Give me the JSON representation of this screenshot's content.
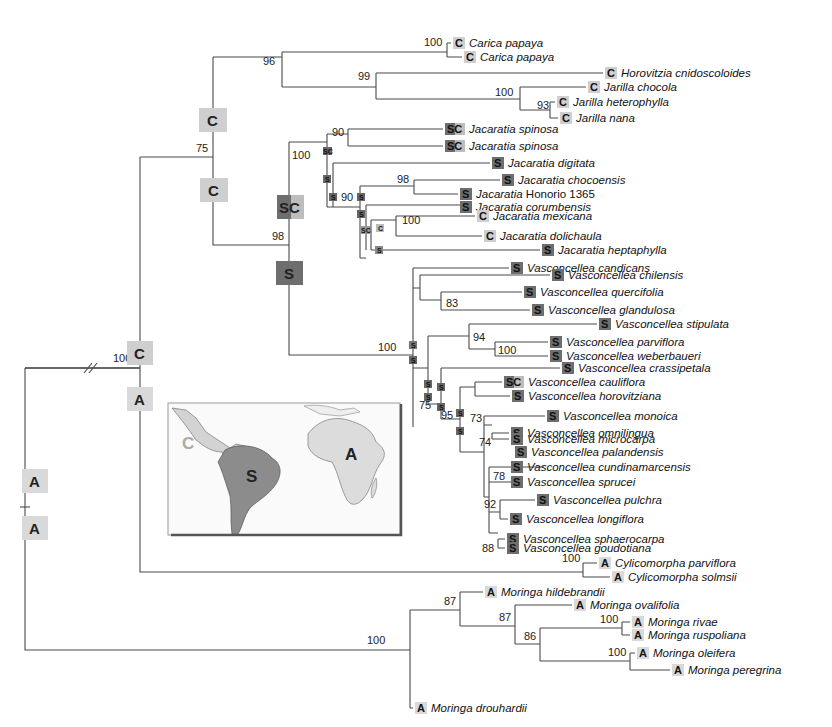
{
  "figure": {
    "type": "phylogenetic-tree",
    "legend_states": {
      "C": "Central America (light grey)",
      "S": "South America (dark grey)",
      "A": "Africa (light grey)",
      "SC": "South + Central America"
    },
    "colors": {
      "C": "#cfcfcf",
      "S": "#6e6e6e",
      "A": "#d9d9d9",
      "line": "#4a4a4a"
    },
    "map_inset": {
      "labels": {
        "C": "C",
        "S": "S",
        "A": "A"
      }
    },
    "root_support": "100",
    "ancestral_states": {
      "root_upper": "A",
      "root_lower": "A",
      "crown_above": "C",
      "crown_below": "A",
      "caricaceae_upper": "C",
      "node75_lower": "C",
      "jacaratia_stem": "SC",
      "vasconcellea_stem": "S"
    },
    "supports": {
      "n96": "96",
      "n75": "75",
      "n100_carica": "100",
      "n99": "99",
      "n100_jarilla": "100",
      "n93": "93",
      "n98": "98",
      "n100_jac": "100",
      "n90_spinosa": "90",
      "n98_choco": "98",
      "n90_jac": "90",
      "n100_mex": "100",
      "n100_vasc": "100",
      "n83": "83",
      "n94": "94",
      "n100_parv": "100",
      "n75_vasc": "75",
      "n95": "95",
      "n73": "73",
      "n74": "74",
      "n78": "78",
      "n92": "92",
      "n88": "88",
      "n100_cylico": "100",
      "n87a": "87",
      "n87b": "87",
      "n86": "86",
      "n100_rivae": "100",
      "n100_oleif": "100",
      "n100_moringa": "100"
    },
    "taxa": [
      {
        "state": "C",
        "genus": "Carica",
        "epithet": "papaya"
      },
      {
        "state": "C",
        "genus": "Carica",
        "epithet": "papaya"
      },
      {
        "state": "C",
        "genus": "Horovitzia",
        "epithet": "cnidoscoloides"
      },
      {
        "state": "C",
        "genus": "Jarilla",
        "epithet": "chocola"
      },
      {
        "state": "C",
        "genus": "Jarilla",
        "epithet": "heterophylla"
      },
      {
        "state": "C",
        "genus": "Jarilla",
        "epithet": "nana"
      },
      {
        "state": "SC",
        "genus": "Jacaratia",
        "epithet": "spinosa"
      },
      {
        "state": "SC",
        "genus": "Jacaratia",
        "epithet": "spinosa"
      },
      {
        "state": "S",
        "genus": "Jacaratia",
        "epithet": "digitata"
      },
      {
        "state": "S",
        "genus": "Jacaratia",
        "epithet": "chocoensis"
      },
      {
        "state": "S",
        "genus": "Jacaratia",
        "epithet": "Honorio 1365"
      },
      {
        "state": "S",
        "genus": "Jacaratia",
        "epithet": "corumbensis"
      },
      {
        "state": "C",
        "genus": "Jacaratia",
        "epithet": "mexicana"
      },
      {
        "state": "C",
        "genus": "Jacaratia",
        "epithet": "dolichaula"
      },
      {
        "state": "S",
        "genus": "Jacaratia",
        "epithet": "heptaphylla"
      },
      {
        "state": "S",
        "genus": "Vasconcellea",
        "epithet": "candicans"
      },
      {
        "state": "S",
        "genus": "Vasconcellea",
        "epithet": "chilensis"
      },
      {
        "state": "S",
        "genus": "Vasconcellea",
        "epithet": "quercifolia"
      },
      {
        "state": "S",
        "genus": "Vasconcellea",
        "epithet": "glandulosa"
      },
      {
        "state": "S",
        "genus": "Vasconcellea",
        "epithet": "stipulata"
      },
      {
        "state": "S",
        "genus": "Vasconcellea",
        "epithet": "parviflora"
      },
      {
        "state": "S",
        "genus": "Vasconcellea",
        "epithet": "weberbaueri"
      },
      {
        "state": "S",
        "genus": "Vasconcellea",
        "epithet": "crassipetala"
      },
      {
        "state": "SC",
        "genus": "Vasconcellea",
        "epithet": "cauliflora"
      },
      {
        "state": "S",
        "genus": "Vasconcellea",
        "epithet": "horovitziana"
      },
      {
        "state": "S",
        "genus": "Vasconcellea",
        "epithet": "monoica"
      },
      {
        "state": "S",
        "genus": "Vasconcellea",
        "epithet": "omnilingua"
      },
      {
        "state": "S",
        "genus": "Vasconcellea",
        "epithet": "microcarpa"
      },
      {
        "state": "S",
        "genus": "Vasconcellea",
        "epithet": "palandensis"
      },
      {
        "state": "S",
        "genus": "Vasconcellea",
        "epithet": "cundinamarcensis"
      },
      {
        "state": "S",
        "genus": "Vasconcellea",
        "epithet": "sprucei"
      },
      {
        "state": "S",
        "genus": "Vasconcellea",
        "epithet": "pulchra"
      },
      {
        "state": "S",
        "genus": "Vasconcellea",
        "epithet": "longiflora"
      },
      {
        "state": "S",
        "genus": "Vasconcellea",
        "epithet": "sphaerocarpa"
      },
      {
        "state": "S",
        "genus": "Vasconcellea",
        "epithet": "goudotiana"
      },
      {
        "state": "A",
        "genus": "Cylicomorpha",
        "epithet": "parviflora"
      },
      {
        "state": "A",
        "genus": "Cylicomorpha",
        "epithet": "solmsii"
      },
      {
        "state": "A",
        "genus": "Moringa",
        "epithet": "hildebrandii"
      },
      {
        "state": "A",
        "genus": "Moringa",
        "epithet": "ovalifolia"
      },
      {
        "state": "A",
        "genus": "Moringa",
        "epithet": "rivae"
      },
      {
        "state": "A",
        "genus": "Moringa",
        "epithet": "ruspoliana"
      },
      {
        "state": "A",
        "genus": "Moringa",
        "epithet": "oleifera"
      },
      {
        "state": "A",
        "genus": "Moringa",
        "epithet": "peregrina"
      },
      {
        "state": "A",
        "genus": "Moringa",
        "epithet": "drouhardii"
      }
    ]
  }
}
